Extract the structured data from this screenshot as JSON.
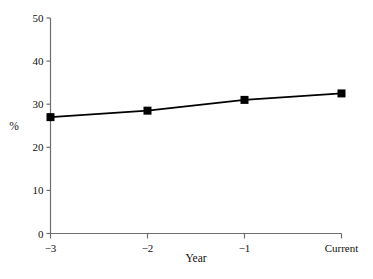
{
  "chart_data": {
    "type": "line",
    "title": "",
    "subtitle": "",
    "xlabel": "Year",
    "ylabel": "%",
    "categories": [
      "-3",
      "-2",
      "-1",
      "Current"
    ],
    "x": [
      -3,
      -2,
      -1,
      0
    ],
    "values": [
      27,
      28.5,
      31,
      32.5
    ],
    "series": [
      {
        "name": "",
        "values": [
          27,
          28.5,
          31,
          32.5
        ]
      }
    ],
    "xlim": [
      -3,
      0
    ],
    "ylim": [
      0,
      50
    ],
    "yticks": [
      0,
      10,
      20,
      30,
      40,
      50
    ],
    "ytick_labels": [
      "0",
      "10",
      "20",
      "30",
      "40",
      "50"
    ],
    "xticks": [
      -3,
      -2,
      -1,
      0
    ],
    "xtick_labels": [
      "−3",
      "−2",
      "−1",
      "Current"
    ],
    "grid": false,
    "legend": null,
    "legend_position": "none",
    "annotations": [],
    "marker": "square",
    "line_color": "#000000",
    "marker_color": "#000000",
    "axis_color": "#6e6e6e",
    "background_color": "#ffffff"
  },
  "axis": {
    "y_title": "%",
    "x_title": "Year"
  }
}
